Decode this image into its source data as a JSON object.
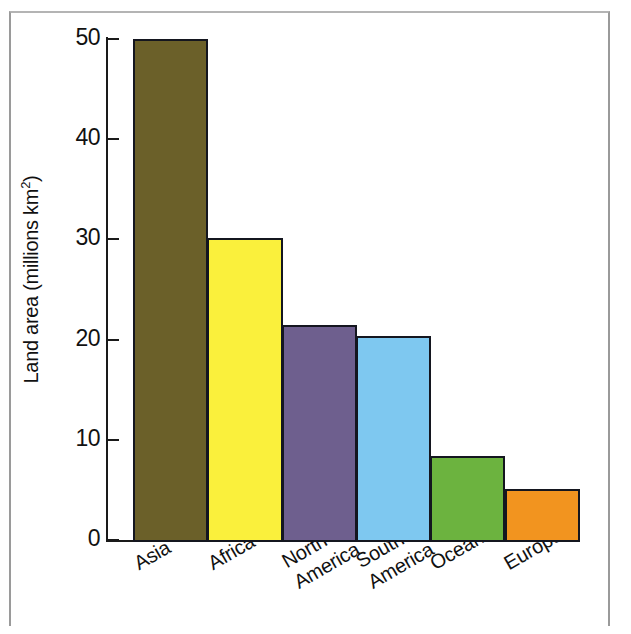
{
  "chart_data": {
    "type": "bar",
    "title": "",
    "xlabel": "",
    "ylabel": "Land area (millions km2)",
    "ylabel_main": "Land area (millions km",
    "ylabel_sup": "2",
    "ylabel_close": ")",
    "ylim": [
      0,
      50
    ],
    "ytick_labels": [
      "50",
      "40",
      "30",
      "20",
      "10",
      "0"
    ],
    "ytick_values": [
      50,
      40,
      30,
      20,
      10,
      0
    ],
    "grid": false,
    "legend": "none",
    "categories": [
      "Asia",
      "Africa",
      "North America",
      "South America",
      "Oceania",
      "Europe"
    ],
    "category_lines": [
      [
        "Asia"
      ],
      [
        "Africa"
      ],
      [
        "North",
        "America"
      ],
      [
        "South",
        "America"
      ],
      [
        "Oceania"
      ],
      [
        "Europe"
      ]
    ],
    "values": [
      50.0,
      30.1,
      21.5,
      20.4,
      8.4,
      5.1
    ],
    "colors": [
      "#6b6029",
      "#faf03c",
      "#6e5f8e",
      "#7ec8f0",
      "#6cb33f",
      "#f2941f"
    ],
    "bar_edge_color": "#14161f",
    "axis_color": "#1a1a1a",
    "background": "#ffffff"
  }
}
